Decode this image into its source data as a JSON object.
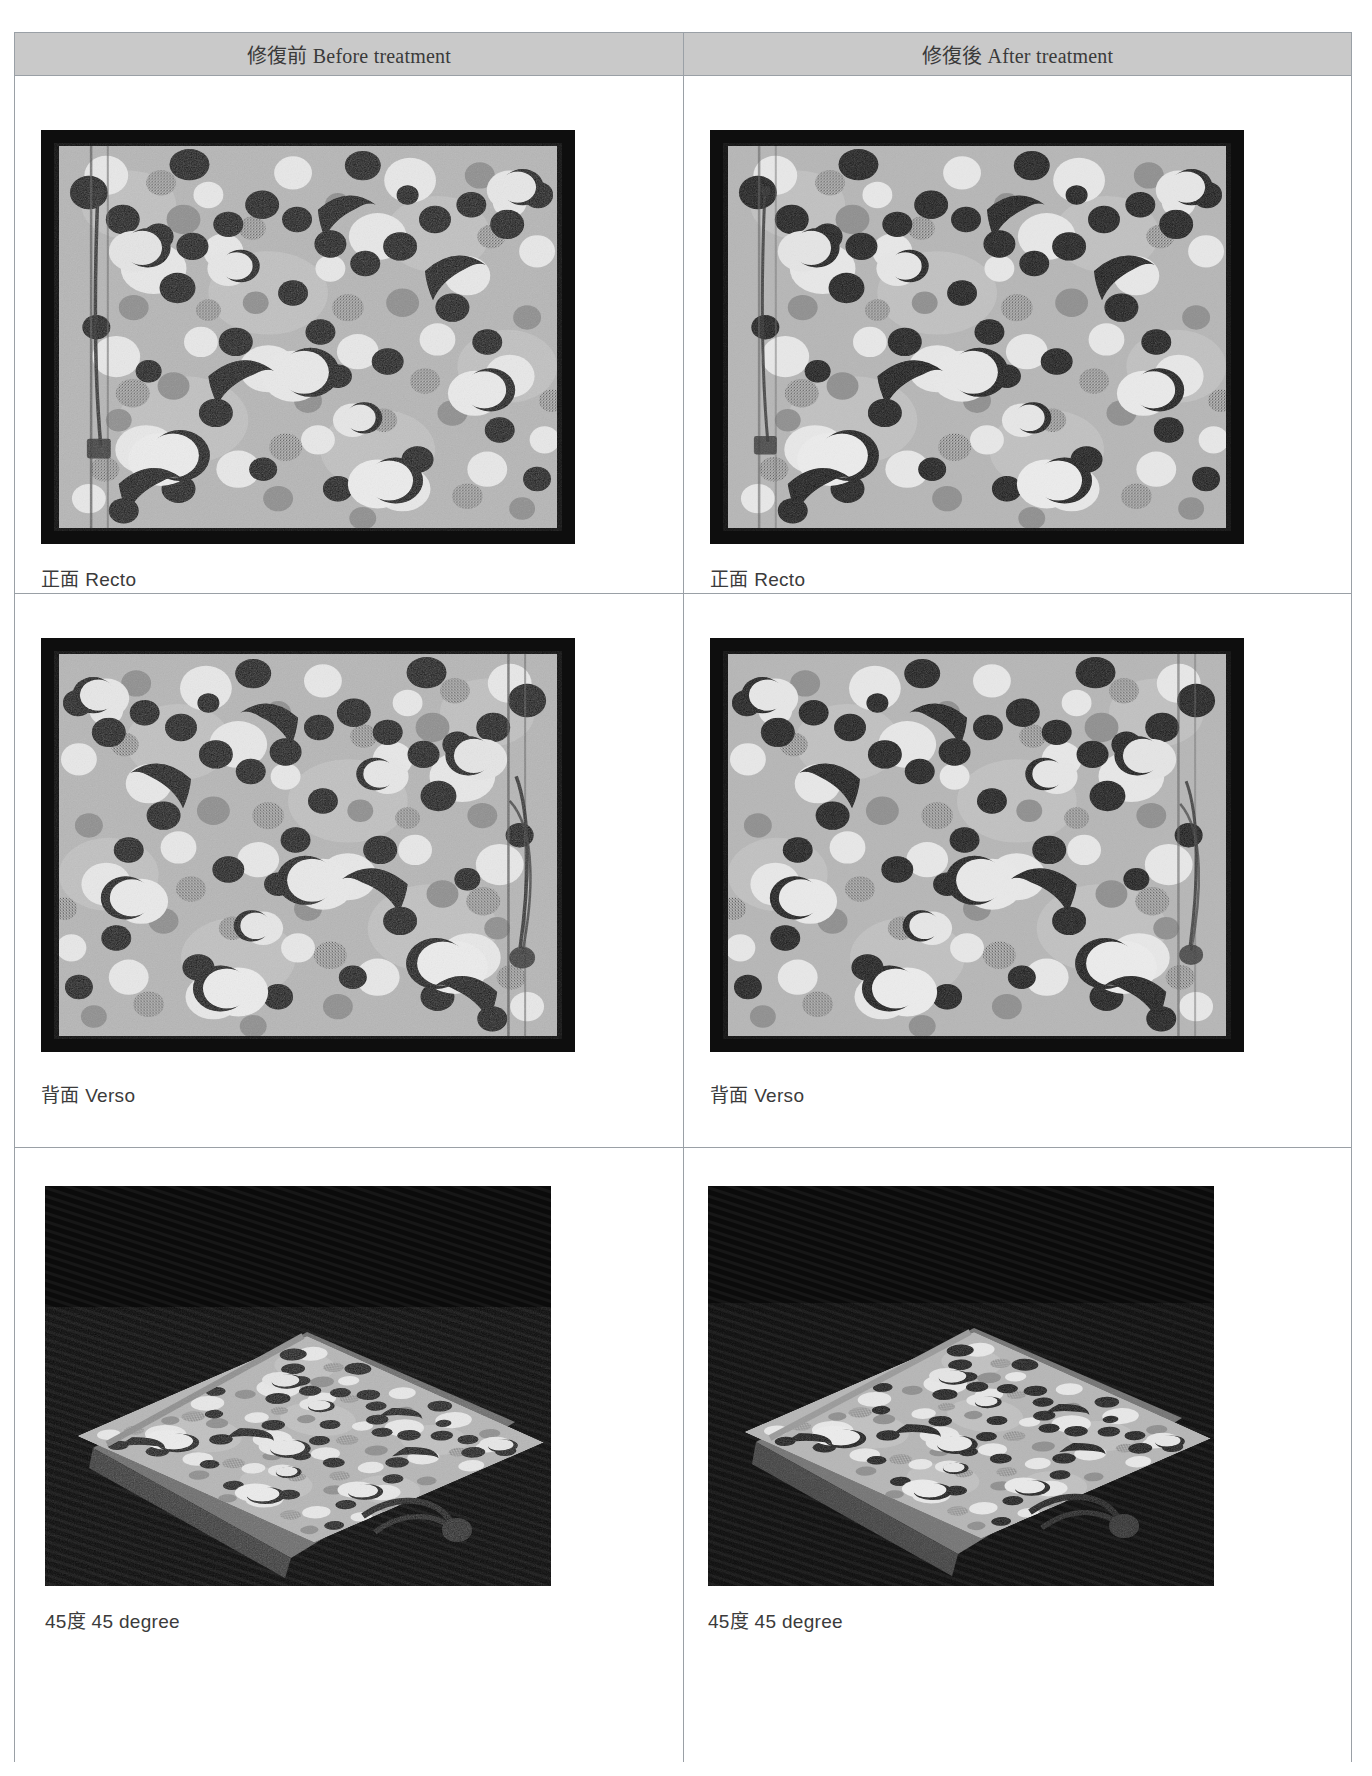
{
  "document": {
    "top_fragment": "",
    "type": "conservation-treatment-comparison-sheet"
  },
  "table": {
    "columns": [
      {
        "id": "before",
        "label": "修復前 Before treatment"
      },
      {
        "id": "after",
        "label": "修復後 After treatment"
      }
    ],
    "rows": [
      {
        "id": "recto",
        "caption": "正面 Recto",
        "cells": [
          {
            "column": "before",
            "caption": "正面 Recto",
            "view": "book-cover-front-flat"
          },
          {
            "column": "after",
            "caption": "正面 Recto",
            "view": "book-cover-front-flat"
          }
        ]
      },
      {
        "id": "verso",
        "caption": "背面 Verso",
        "cells": [
          {
            "column": "before",
            "caption": "背面 Verso",
            "view": "book-cover-back-flat"
          },
          {
            "column": "after",
            "caption": "背面 Verso",
            "view": "book-cover-back-flat"
          }
        ]
      },
      {
        "id": "angle45",
        "caption": "45度 45 degree",
        "cells": [
          {
            "column": "before",
            "caption": "45度 45 degree",
            "view": "book-three-quarter-on-dark-ground"
          },
          {
            "column": "after",
            "caption": "45度 45 degree",
            "view": "book-three-quarter-on-dark-ground"
          }
        ]
      }
    ]
  },
  "colors": {
    "header_band": "#c9c9c9",
    "rule": "#9aa0a6",
    "caption_text": "#3b3b3b",
    "header_text": "#3a3a3a",
    "photo_border": "#141414",
    "cover_paper": "#b4b4b4",
    "dark_ground": "#0c0c0c"
  },
  "figures": {
    "flat": {
      "width": 534,
      "height": 414
    },
    "flat_r2": {
      "width": 534,
      "height": 414
    },
    "angle": {
      "width": 506,
      "height": 400
    }
  }
}
